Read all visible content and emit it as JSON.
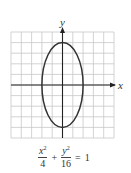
{
  "figure": {
    "type": "ellipse-graph",
    "grid": {
      "x_min": -5,
      "x_max": 5,
      "y_min": -5,
      "y_max": 5,
      "step": 1,
      "color": "#c8c8c8"
    },
    "axes": {
      "x_label": "x",
      "y_label": "y",
      "color": "#222222"
    },
    "ellipse": {
      "center": [
        0,
        0
      ],
      "semi_axis_x": 2,
      "semi_axis_y": 4,
      "stroke": "#333333"
    }
  },
  "equation": {
    "term1_numerator": "x",
    "term1_exponent": "2",
    "term1_denominator": "4",
    "operator": "+",
    "term2_numerator": "y",
    "term2_exponent": "2",
    "term2_denominator": "16",
    "equals": "=",
    "rhs": "1"
  }
}
